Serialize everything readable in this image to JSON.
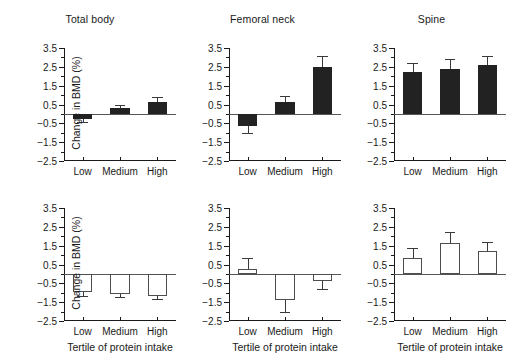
{
  "figure": {
    "xlabel": "Tertile of protein intake",
    "ylabel": "Change in BMD (%)",
    "categories": [
      "Low",
      "Medium",
      "High"
    ],
    "yticks": [
      "3.5",
      "2.5",
      "1.5",
      "0.5",
      "-0.5",
      "-1.5",
      "-2.5"
    ],
    "ytick_values": [
      3.5,
      2.5,
      1.5,
      0.5,
      -0.5,
      -1.5,
      -2.5
    ],
    "ylim": [
      -2.5,
      3.5
    ],
    "panel_titles": [
      "Total body",
      "Femoral neck",
      "Spine"
    ],
    "colors": {
      "filled_bar": "#222222",
      "open_bar": "#ffffff",
      "bar_outline": "#4d4d4d",
      "axis": "#1a1a1a",
      "error_bar": "#3a3a3a",
      "background": "#ffffff"
    }
  },
  "chart_data": [
    {
      "type": "bar",
      "title": "Total body",
      "row": "top",
      "bar_style": "filled",
      "categories": [
        "Low",
        "Medium",
        "High"
      ],
      "values": [
        -0.25,
        0.3,
        0.65
      ],
      "errors": [
        0.2,
        0.2,
        0.25
      ],
      "xlabel": "Tertile of protein intake",
      "ylabel": "Change in BMD (%)",
      "ylim": [
        -2.5,
        3.5
      ],
      "grid": false,
      "legend": "none"
    },
    {
      "type": "bar",
      "title": "Femoral neck",
      "row": "top",
      "bar_style": "filled",
      "categories": [
        "Low",
        "Medium",
        "High"
      ],
      "values": [
        -0.65,
        0.65,
        2.5
      ],
      "errors": [
        0.35,
        0.3,
        0.6
      ],
      "xlabel": "Tertile of protein intake",
      "ylabel": "Change in BMD (%)",
      "ylim": [
        -2.5,
        3.5
      ],
      "grid": false,
      "legend": "none"
    },
    {
      "type": "bar",
      "title": "Spine",
      "row": "top",
      "bar_style": "filled",
      "categories": [
        "Low",
        "Medium",
        "High"
      ],
      "values": [
        2.2,
        2.4,
        2.6
      ],
      "errors": [
        0.5,
        0.5,
        0.5
      ],
      "xlabel": "Tertile of protein intake",
      "ylabel": "Change in BMD (%)",
      "ylim": [
        -2.5,
        3.5
      ],
      "grid": false,
      "legend": "none"
    },
    {
      "type": "bar",
      "title": "Total body",
      "row": "bottom",
      "bar_style": "open",
      "categories": [
        "Low",
        "Medium",
        "High"
      ],
      "values": [
        -0.95,
        -1.05,
        -1.15
      ],
      "errors": [
        0.2,
        0.2,
        0.2
      ],
      "xlabel": "Tertile of protein intake",
      "ylabel": "Change in BMD (%)",
      "ylim": [
        -2.5,
        3.5
      ],
      "grid": false,
      "legend": "none"
    },
    {
      "type": "bar",
      "title": "Femoral neck",
      "row": "bottom",
      "bar_style": "open",
      "categories": [
        "Low",
        "Medium",
        "High"
      ],
      "values": [
        0.25,
        -1.4,
        -0.4
      ],
      "errors": [
        0.6,
        0.6,
        0.4
      ],
      "xlabel": "Tertile of protein intake",
      "ylabel": "Change in BMD (%)",
      "ylim": [
        -2.5,
        3.5
      ],
      "grid": false,
      "legend": "none"
    },
    {
      "type": "bar",
      "title": "Spine",
      "row": "bottom",
      "bar_style": "open",
      "categories": [
        "Low",
        "Medium",
        "High"
      ],
      "values": [
        0.85,
        1.65,
        1.2
      ],
      "errors": [
        0.55,
        0.55,
        0.5
      ],
      "xlabel": "Tertile of protein intake",
      "ylabel": "Change in BMD (%)",
      "ylim": [
        -2.5,
        3.5
      ],
      "grid": false,
      "legend": "none"
    }
  ]
}
